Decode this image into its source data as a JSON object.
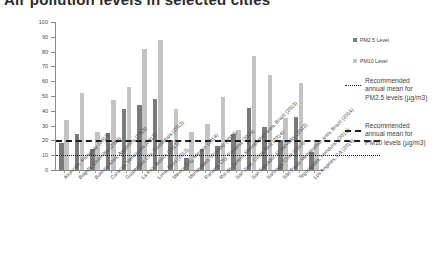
{
  "title": "Air pollution levels in selected cities",
  "chart_data": {
    "type": "bar",
    "title": "Air pollution levels in selected cities",
    "xlabel": "",
    "ylabel": "",
    "ylim": [
      0,
      100
    ],
    "yticks": [
      0,
      10,
      20,
      30,
      40,
      50,
      60,
      70,
      80,
      90,
      100
    ],
    "grid": false,
    "legend_position": "right",
    "categories": [
      "Asunción, Paraguay (2016)",
      "Bogotá, Colombia (2014)",
      "Buenos Aires, Argentina (2015)",
      "Caracas, Venezuela (2012)",
      "Guatemala City, Guatemala (2013)",
      "La Paz, Bolivia (2013)",
      "Lima, Peru (2013)",
      "Mexico City, Mexico (2014)",
      "Montevideo, Uruguay (2014)",
      "Panama City, Panama (2014)",
      "Rio de Janeiro Metropolitan area, Brazil (2013)",
      "San José, Costa Rica (2014)",
      "San Salvador, El Salvador (2013)",
      "Santiago, Chile (2014)",
      "São Paulo Metropolitan area, Brazil (2014)",
      "Tegucigalpa, Honduras (2013)",
      "Los Angeles, CA (2014)"
    ],
    "series": [
      {
        "name": "PM2.5 Level",
        "color": "#7a7a7a",
        "values": [
          18,
          24,
          14,
          25,
          41,
          44,
          48,
          20,
          8,
          14,
          16.5,
          24.5,
          42,
          29,
          20,
          36,
          12
        ]
      },
      {
        "name": "PM10 Level",
        "color": "#c3c3c3",
        "values": [
          34,
          52,
          26,
          47,
          56,
          82,
          88,
          41,
          26,
          31,
          49,
          27,
          77,
          64,
          35,
          59,
          19
        ]
      }
    ],
    "reference_lines": [
      {
        "name": "Recommended annual mean for PM2.5 levels (µg/m3)",
        "value": 10,
        "style": "dotted",
        "color": "#1b1b1b"
      },
      {
        "name": "Recommended annual mean for PM10 levels (µg/m3)",
        "value": 20,
        "style": "dashed",
        "color": "#1b1b1b"
      }
    ]
  },
  "legend": {
    "items": [
      {
        "label": "PM2.5 Level",
        "color": "#7a7a7a"
      },
      {
        "label": "PM10 Level",
        "color": "#c3c3c3"
      }
    ],
    "reference": [
      {
        "label": "Recommended annual mean for PM2.5 levels (µg/m3)",
        "style": "dotted"
      },
      {
        "label": "Recommended annual mean for PM10 levels (µg/m3)",
        "style": "dashed"
      }
    ]
  }
}
